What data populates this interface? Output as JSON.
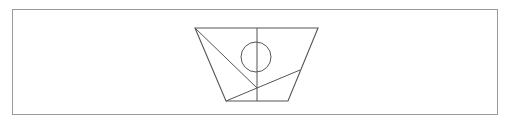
{
  "figure": {
    "type": "geometry-diagram",
    "stroke_color": "#555555",
    "border_color": "#9a9a9a",
    "trapezoid": {
      "top_left": [
        195,
        28
      ],
      "top_right": [
        318,
        28
      ],
      "bottom_right": [
        288,
        101
      ],
      "bottom_left": [
        226,
        101
      ]
    },
    "vertical_line": {
      "from": [
        257,
        28
      ],
      "to": [
        257,
        101
      ]
    },
    "diagonal_line": {
      "from": [
        195,
        28
      ],
      "to": [
        257,
        88
      ]
    },
    "chord_line": {
      "from": [
        226,
        101
      ],
      "to": [
        300,
        70
      ]
    },
    "circle": {
      "cx": 256,
      "cy": 57,
      "r": 15
    }
  }
}
